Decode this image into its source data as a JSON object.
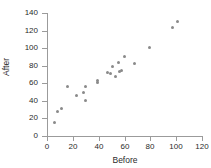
{
  "chart_data": {
    "type": "scatter",
    "title": "",
    "xlabel": "Before",
    "ylabel": "After",
    "xlim": [
      0,
      120
    ],
    "ylim": [
      0,
      140
    ],
    "xticks": [
      0,
      20,
      40,
      60,
      80,
      100,
      120
    ],
    "yticks": [
      0,
      20,
      40,
      60,
      80,
      100,
      120,
      140
    ],
    "grid": false,
    "legend": null,
    "marker_color": "#8a8a8a",
    "axis_color": "#9b9b9b",
    "series": [
      {
        "name": "observations",
        "points": [
          {
            "x": 6,
            "y": 15
          },
          {
            "x": 8,
            "y": 28
          },
          {
            "x": 11,
            "y": 31
          },
          {
            "x": 16,
            "y": 56
          },
          {
            "x": 23,
            "y": 46
          },
          {
            "x": 28,
            "y": 50
          },
          {
            "x": 30,
            "y": 56
          },
          {
            "x": 30,
            "y": 40
          },
          {
            "x": 39,
            "y": 63
          },
          {
            "x": 39,
            "y": 61
          },
          {
            "x": 47,
            "y": 72
          },
          {
            "x": 49,
            "y": 71
          },
          {
            "x": 51,
            "y": 79
          },
          {
            "x": 53,
            "y": 68
          },
          {
            "x": 55,
            "y": 84
          },
          {
            "x": 56,
            "y": 73
          },
          {
            "x": 58,
            "y": 74
          },
          {
            "x": 60,
            "y": 91
          },
          {
            "x": 68,
            "y": 82
          },
          {
            "x": 79,
            "y": 101
          },
          {
            "x": 97,
            "y": 123
          },
          {
            "x": 101,
            "y": 130
          }
        ]
      }
    ]
  }
}
